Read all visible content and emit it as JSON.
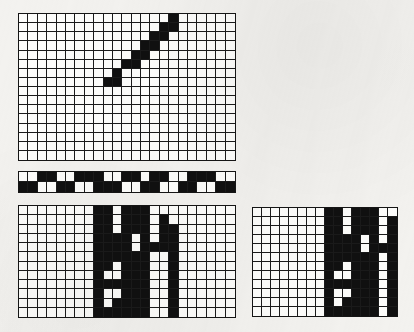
{
  "figure": {
    "background_color": "#f3f2ef",
    "grid_line_color": "#1a1a1a",
    "cell_on_color": "#101010",
    "cell_off_color": "#fdfdfb"
  },
  "panels": [
    {
      "id": "top-grid",
      "name": "Upper diagonal grid",
      "x": 18,
      "y": 13,
      "width": 218,
      "height": 148,
      "columns": 23,
      "rows": 16,
      "pattern_note": "Rising staircase diagonal from lower-left to upper-right",
      "cells": [
        [
          0,
          0,
          0,
          0,
          0,
          0,
          0,
          0,
          0,
          0,
          0,
          0,
          0,
          0,
          0,
          0,
          1,
          0,
          0,
          0,
          0,
          0,
          0
        ],
        [
          0,
          0,
          0,
          0,
          0,
          0,
          0,
          0,
          0,
          0,
          0,
          0,
          0,
          0,
          0,
          1,
          1,
          0,
          0,
          0,
          0,
          0,
          0
        ],
        [
          0,
          0,
          0,
          0,
          0,
          0,
          0,
          0,
          0,
          0,
          0,
          0,
          0,
          0,
          1,
          1,
          0,
          0,
          0,
          0,
          0,
          0,
          0
        ],
        [
          0,
          0,
          0,
          0,
          0,
          0,
          0,
          0,
          0,
          0,
          0,
          0,
          0,
          1,
          1,
          0,
          0,
          0,
          0,
          0,
          0,
          0,
          0
        ],
        [
          0,
          0,
          0,
          0,
          0,
          0,
          0,
          0,
          0,
          0,
          0,
          0,
          1,
          1,
          0,
          0,
          0,
          0,
          0,
          0,
          0,
          0,
          0
        ],
        [
          0,
          0,
          0,
          0,
          0,
          0,
          0,
          0,
          0,
          0,
          0,
          1,
          1,
          0,
          0,
          0,
          0,
          0,
          0,
          0,
          0,
          0,
          0
        ],
        [
          0,
          0,
          0,
          0,
          0,
          0,
          0,
          0,
          0,
          0,
          1,
          0,
          0,
          0,
          0,
          0,
          0,
          0,
          0,
          0,
          0,
          0,
          0
        ],
        [
          0,
          0,
          0,
          0,
          0,
          0,
          0,
          0,
          0,
          1,
          1,
          0,
          0,
          0,
          0,
          0,
          0,
          0,
          0,
          0,
          0,
          0,
          0
        ],
        [
          0,
          0,
          0,
          0,
          0,
          0,
          0,
          0,
          0,
          0,
          0,
          0,
          0,
          0,
          0,
          0,
          0,
          0,
          0,
          0,
          0,
          0,
          0
        ],
        [
          0,
          0,
          0,
          0,
          0,
          0,
          0,
          0,
          0,
          0,
          0,
          0,
          0,
          0,
          0,
          0,
          0,
          0,
          0,
          0,
          0,
          0,
          0
        ],
        [
          0,
          0,
          0,
          0,
          0,
          0,
          0,
          0,
          0,
          0,
          0,
          0,
          0,
          0,
          0,
          0,
          0,
          0,
          0,
          0,
          0,
          0,
          0
        ],
        [
          0,
          0,
          0,
          0,
          0,
          0,
          0,
          0,
          0,
          0,
          0,
          0,
          0,
          0,
          0,
          0,
          0,
          0,
          0,
          0,
          0,
          0,
          0
        ],
        [
          0,
          0,
          0,
          0,
          0,
          0,
          0,
          0,
          0,
          0,
          0,
          0,
          0,
          0,
          0,
          0,
          0,
          0,
          0,
          0,
          0,
          0,
          0
        ],
        [
          0,
          0,
          0,
          0,
          0,
          0,
          0,
          0,
          0,
          0,
          0,
          0,
          0,
          0,
          0,
          0,
          0,
          0,
          0,
          0,
          0,
          0,
          0
        ],
        [
          0,
          0,
          0,
          0,
          0,
          0,
          0,
          0,
          0,
          0,
          0,
          0,
          0,
          0,
          0,
          0,
          0,
          0,
          0,
          0,
          0,
          0,
          0
        ],
        [
          0,
          0,
          0,
          0,
          0,
          0,
          0,
          0,
          0,
          0,
          0,
          0,
          0,
          0,
          0,
          0,
          0,
          0,
          0,
          0,
          0,
          0,
          0
        ]
      ]
    },
    {
      "id": "mid-strip",
      "name": "Alternating barcode strip",
      "x": 18,
      "y": 171,
      "width": 218,
      "height": 22,
      "columns": 23,
      "rows": 2,
      "pattern_note": "Two rows of offset black and white blocks forming a barcode band",
      "cells": [
        [
          0,
          0,
          1,
          1,
          0,
          0,
          1,
          1,
          1,
          0,
          0,
          1,
          1,
          0,
          1,
          1,
          0,
          0,
          1,
          1,
          1,
          0,
          0
        ],
        [
          1,
          1,
          0,
          0,
          1,
          1,
          0,
          0,
          1,
          1,
          1,
          0,
          0,
          1,
          1,
          0,
          0,
          1,
          1,
          0,
          0,
          1,
          1
        ]
      ]
    },
    {
      "id": "bottom-left-grid",
      "name": "Lower left block-glyph grid",
      "x": 18,
      "y": 205,
      "width": 218,
      "height": 113,
      "columns": 23,
      "rows": 12,
      "pattern_note": "Dense black block glyphs occupying the central and right columns",
      "cells": [
        [
          0,
          0,
          0,
          0,
          0,
          0,
          0,
          0,
          1,
          1,
          0,
          1,
          1,
          1,
          0,
          0,
          0,
          0,
          0,
          0,
          0,
          0,
          0
        ],
        [
          0,
          0,
          0,
          0,
          0,
          0,
          0,
          0,
          1,
          1,
          0,
          1,
          1,
          1,
          0,
          1,
          0,
          0,
          0,
          0,
          0,
          0,
          0
        ],
        [
          0,
          0,
          0,
          0,
          0,
          0,
          0,
          0,
          1,
          1,
          0,
          1,
          1,
          1,
          0,
          1,
          1,
          0,
          0,
          0,
          0,
          0,
          0
        ],
        [
          0,
          0,
          0,
          0,
          0,
          0,
          0,
          0,
          1,
          1,
          1,
          1,
          0,
          1,
          0,
          1,
          1,
          0,
          0,
          0,
          0,
          0,
          0
        ],
        [
          0,
          0,
          0,
          0,
          0,
          0,
          0,
          0,
          1,
          1,
          1,
          1,
          0,
          1,
          1,
          1,
          1,
          0,
          0,
          0,
          0,
          0,
          0
        ],
        [
          0,
          0,
          0,
          0,
          0,
          0,
          0,
          0,
          1,
          1,
          1,
          1,
          1,
          1,
          0,
          0,
          1,
          0,
          0,
          0,
          0,
          0,
          0
        ],
        [
          0,
          0,
          0,
          0,
          0,
          0,
          0,
          0,
          1,
          1,
          0,
          1,
          1,
          1,
          0,
          0,
          1,
          0,
          0,
          0,
          0,
          0,
          0
        ],
        [
          0,
          0,
          0,
          0,
          0,
          0,
          0,
          0,
          1,
          0,
          0,
          1,
          1,
          1,
          0,
          0,
          1,
          0,
          0,
          0,
          0,
          0,
          0
        ],
        [
          0,
          0,
          0,
          0,
          0,
          0,
          0,
          0,
          1,
          1,
          1,
          1,
          1,
          1,
          0,
          0,
          1,
          0,
          0,
          0,
          0,
          0,
          0
        ],
        [
          0,
          0,
          0,
          0,
          0,
          0,
          0,
          0,
          1,
          0,
          0,
          1,
          1,
          1,
          0,
          0,
          1,
          0,
          0,
          0,
          0,
          0,
          0
        ],
        [
          0,
          0,
          0,
          0,
          0,
          0,
          0,
          0,
          1,
          0,
          1,
          1,
          1,
          1,
          0,
          0,
          1,
          0,
          0,
          0,
          0,
          0,
          0
        ],
        [
          0,
          0,
          0,
          0,
          0,
          0,
          0,
          0,
          1,
          1,
          1,
          1,
          1,
          1,
          0,
          0,
          1,
          0,
          0,
          0,
          0,
          0,
          0
        ]
      ]
    },
    {
      "id": "bottom-right-grid",
      "name": "Lower right block-glyph grid",
      "x": 252,
      "y": 207,
      "width": 146,
      "height": 110,
      "columns": 16,
      "rows": 12,
      "pattern_note": "Smaller companion grid with the same style of dense black glyph blocks on its right half",
      "cells": [
        [
          0,
          0,
          0,
          0,
          0,
          0,
          0,
          0,
          1,
          1,
          0,
          1,
          1,
          1,
          0,
          0
        ],
        [
          0,
          0,
          0,
          0,
          0,
          0,
          0,
          0,
          1,
          1,
          0,
          1,
          1,
          1,
          0,
          1
        ],
        [
          0,
          0,
          0,
          0,
          0,
          0,
          0,
          0,
          1,
          1,
          0,
          1,
          1,
          1,
          0,
          1
        ],
        [
          0,
          0,
          0,
          0,
          0,
          0,
          0,
          0,
          1,
          1,
          1,
          1,
          0,
          1,
          0,
          1
        ],
        [
          0,
          0,
          0,
          0,
          0,
          0,
          0,
          0,
          1,
          1,
          1,
          1,
          0,
          1,
          1,
          1
        ],
        [
          0,
          0,
          0,
          0,
          0,
          0,
          0,
          0,
          1,
          1,
          1,
          1,
          1,
          1,
          0,
          1
        ],
        [
          0,
          0,
          0,
          0,
          0,
          0,
          0,
          0,
          1,
          1,
          0,
          1,
          1,
          1,
          0,
          1
        ],
        [
          0,
          0,
          0,
          0,
          0,
          0,
          0,
          0,
          1,
          0,
          0,
          1,
          1,
          1,
          0,
          1
        ],
        [
          0,
          0,
          0,
          0,
          0,
          0,
          0,
          0,
          1,
          1,
          1,
          1,
          1,
          1,
          0,
          1
        ],
        [
          0,
          0,
          0,
          0,
          0,
          0,
          0,
          0,
          1,
          0,
          0,
          1,
          1,
          1,
          0,
          1
        ],
        [
          0,
          0,
          0,
          0,
          0,
          0,
          0,
          0,
          1,
          0,
          1,
          1,
          1,
          1,
          0,
          1
        ],
        [
          0,
          0,
          0,
          0,
          0,
          0,
          0,
          0,
          1,
          1,
          1,
          1,
          1,
          1,
          0,
          1
        ]
      ]
    }
  ]
}
